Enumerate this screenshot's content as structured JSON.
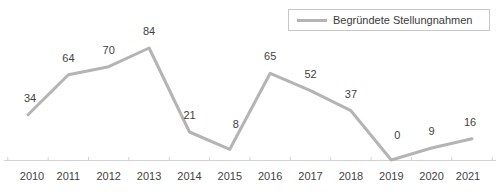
{
  "chart_data": {
    "type": "line",
    "title": "",
    "subtitle": "",
    "xlabel": "",
    "ylabel": "",
    "grid": false,
    "legend_position": "top-right",
    "categories": [
      "2010",
      "2011",
      "2012",
      "2013",
      "2014",
      "2015",
      "2016",
      "2017",
      "2018",
      "2019",
      "2020",
      "2021"
    ],
    "series": [
      {
        "name": "Begründete Stellungnahmen",
        "color": "#b4b4b4",
        "values": [
          34,
          64,
          70,
          84,
          21,
          8,
          65,
          52,
          37,
          0,
          9,
          16
        ]
      }
    ],
    "ylim": [
      0,
      92
    ],
    "data_labels": [
      "34",
      "64",
      "70",
      "84",
      "21",
      "8",
      "65",
      "52",
      "37",
      "0",
      "9",
      "16"
    ]
  },
  "legend": {
    "entries": [
      {
        "label": "Begründete Stellungnahmen",
        "color": "#b4b4b4"
      }
    ]
  },
  "axis": {
    "x_tick_labels": [
      "2010",
      "2011",
      "2012",
      "2013",
      "2014",
      "2015",
      "2016",
      "2017",
      "2018",
      "2019",
      "2020",
      "2021"
    ]
  }
}
